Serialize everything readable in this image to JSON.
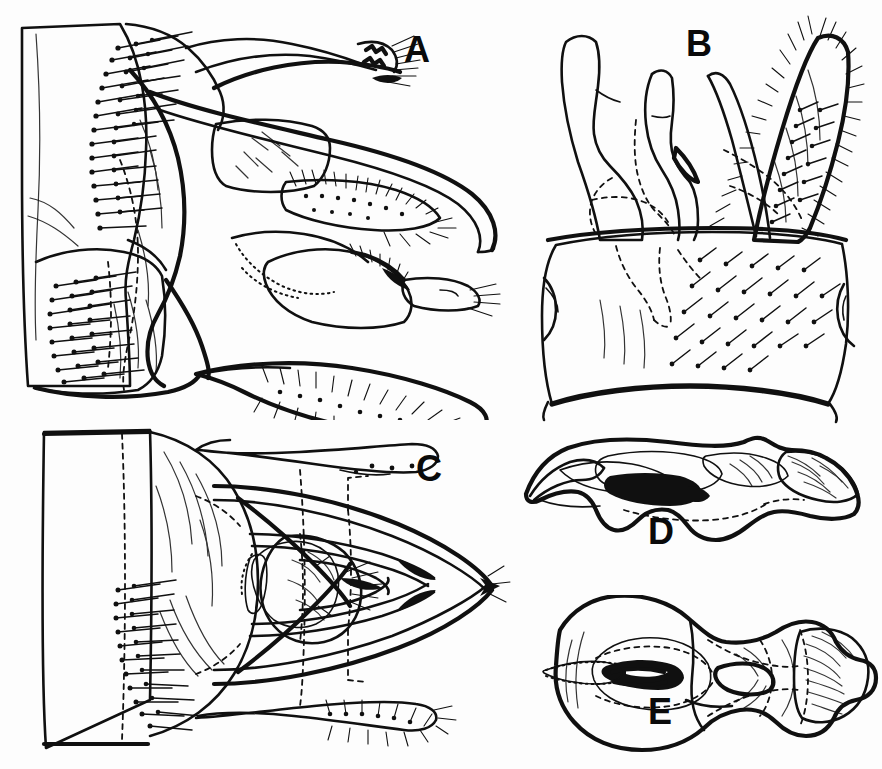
{
  "figure": {
    "kind": "scientific-line-illustration",
    "background_color": "#fdfdfd",
    "ink_color": "#101010",
    "width": 882,
    "height": 769,
    "panel_count": 5
  },
  "panels": [
    {
      "id": "A",
      "label": "A",
      "view": "lateral view of terminalia",
      "label_x": 404,
      "label_y": 32,
      "features": [
        "segment margin",
        "socketed setae row",
        "curved elongate claspers",
        "dotted internal outline",
        "setose lobe"
      ]
    },
    {
      "id": "B",
      "label": "B",
      "view": "posterior view of terminalia",
      "label_x": 686,
      "label_y": 26,
      "features": [
        "paired processes",
        "dense setose lobe",
        "dashed hidden margin",
        "broad basal plate"
      ]
    },
    {
      "id": "C",
      "label": "C",
      "view": "dorsal view of terminalia",
      "label_x": 416,
      "label_y": 451,
      "features": [
        "rectangular segment",
        "symmetric curved arms",
        "pointed apex",
        "stippled median sclerite",
        "marginal setae"
      ]
    },
    {
      "id": "D",
      "label": "D",
      "view": "aedeagus, lateral",
      "label_x": 648,
      "label_y": 514,
      "features": [
        "hooked apex",
        "stippled shading",
        "dark sclerotised blotch",
        "dashed ventral outline"
      ]
    },
    {
      "id": "E",
      "label": "E",
      "view": "aedeagus, ventral",
      "label_x": 648,
      "label_y": 694,
      "features": [
        "bulbous base",
        "stippled ring",
        "paired dark sclerites",
        "striated apical lobe"
      ]
    }
  ]
}
